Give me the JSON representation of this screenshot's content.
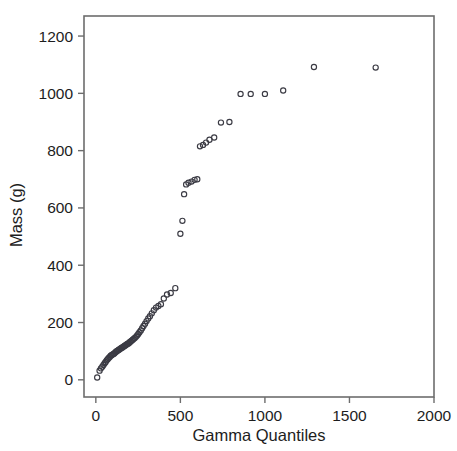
{
  "chart_data": {
    "type": "scatter",
    "title": "",
    "xlabel": "Gamma Quantiles",
    "ylabel": "Mass (g)",
    "xlim": [
      -70,
      2000
    ],
    "ylim": [
      -60,
      1270
    ],
    "xticks": [
      0,
      500,
      1000,
      1500,
      2000
    ],
    "yticks": [
      0,
      200,
      400,
      600,
      800,
      1000,
      1200
    ],
    "xtick_labels": [
      "0",
      "500",
      "1000",
      "1500",
      "2000"
    ],
    "ytick_labels": [
      "0",
      "200",
      "400",
      "600",
      "800",
      "1000",
      "1200"
    ],
    "grid": false,
    "legend": null,
    "marker": {
      "shape": "open-circle",
      "radius": 2.6,
      "stroke": "#3b3b44",
      "fill": "none"
    },
    "frame_color": "#6d6d6d",
    "series": [
      {
        "name": "Mass vs Gamma Quantiles",
        "x": [
          8,
          22,
          30,
          38,
          45,
          52,
          58,
          64,
          70,
          76,
          82,
          88,
          93,
          98,
          104,
          109,
          114,
          119,
          124,
          129,
          134,
          139,
          144,
          149,
          154,
          159,
          164,
          169,
          174,
          179,
          184,
          189,
          195,
          200,
          206,
          212,
          218,
          224,
          230,
          237,
          244,
          251,
          258,
          266,
          274,
          282,
          291,
          300,
          310,
          320,
          331,
          343,
          356,
          370,
          385,
          402,
          421,
          443,
          470,
          500,
          512,
          522,
          534,
          548,
          566,
          584,
          600,
          616,
          634,
          652,
          672,
          700,
          740,
          790,
          856,
          916,
          1000,
          1108,
          1290,
          1655
        ],
        "y": [
          8,
          32,
          40,
          46,
          52,
          58,
          62,
          68,
          72,
          76,
          80,
          84,
          86,
          88,
          90,
          92,
          95,
          98,
          100,
          102,
          104,
          106,
          108,
          110,
          112,
          114,
          116,
          118,
          120,
          122,
          124,
          126,
          128,
          131,
          134,
          137,
          140,
          143,
          146,
          150,
          155,
          160,
          166,
          172,
          180,
          188,
          196,
          205,
          214,
          222,
          232,
          243,
          252,
          258,
          264,
          284,
          298,
          303,
          320,
          510,
          555,
          648,
          682,
          688,
          692,
          698,
          700,
          815,
          820,
          828,
          838,
          846,
          898,
          900,
          998,
          998,
          998,
          1010,
          1092,
          1090
        ]
      }
    ]
  }
}
